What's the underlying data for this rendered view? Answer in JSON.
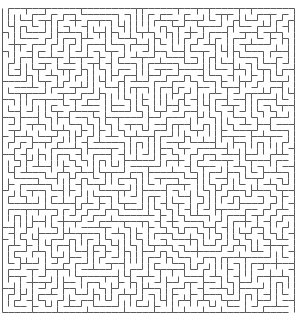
{
  "maze": {
    "cols": 48,
    "rows": 50,
    "origin_x": 2,
    "origin_y": 8,
    "cell_w": 6.08,
    "cell_h": 6.08,
    "wall_color": "#5a5a5a",
    "background_color": "#ffffff",
    "wall_width": 1,
    "seed": 20240,
    "entrance": {
      "side": "top",
      "col": 0
    },
    "exit": {
      "side": "bottom",
      "col": 47
    }
  }
}
